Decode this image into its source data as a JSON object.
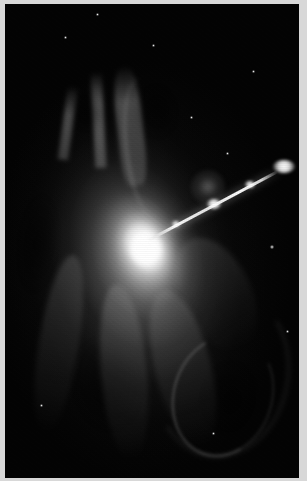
{
  "image": {
    "kind": "astronomical-photograph",
    "subject": "active galaxy with relativistic jet",
    "color_mode": "grayscale",
    "width_px": 307,
    "height_px": 481,
    "alt_text": "Grayscale astronomical image of an elliptical galaxy with a bright nucleus and a narrow jet of knots extending toward the upper right, surrounded by a diffuse filamentary halo."
  },
  "frame": {
    "border_color": "#d8d8d8",
    "sky_color": "#050505"
  },
  "features": {
    "nucleus": {
      "label": "galaxy-nucleus",
      "center_x_px": 140,
      "center_y_px": 247,
      "peak_color": "#ffffff"
    },
    "bulge": {
      "label": "inner-bulge",
      "center_x_px": 141,
      "center_y_px": 245,
      "position_angle_deg": -22
    },
    "halo": {
      "label": "diffuse-halo",
      "center_x_px": 135,
      "center_y_px": 270,
      "position_angle_deg": -14
    },
    "jet": {
      "label": "relativistic-jet",
      "origin_x_px": 148,
      "origin_y_px": 240,
      "terminus_x_px": 288,
      "terminus_y_px": 166,
      "angle_deg": -28,
      "knots": [
        {
          "name": "knot-inner",
          "x_px": 176,
          "y_px": 225,
          "size_px": 7
        },
        {
          "name": "knot-middle",
          "x_px": 213,
          "y_px": 205,
          "size_px": 11
        },
        {
          "name": "knot-outer",
          "x_px": 249,
          "y_px": 186,
          "size_px": 8
        },
        {
          "name": "knot-terminal",
          "x_px": 283,
          "y_px": 170,
          "size_px": 17
        }
      ]
    },
    "shells": [
      {
        "name": "shell-arc-lower-right",
        "x_px": 173,
        "y_px": 334
      },
      {
        "name": "shell-arc-outer",
        "x_px": 155,
        "y_px": 290
      }
    ],
    "plumes": [
      {
        "name": "plume-north-left",
        "x_px": 72,
        "y_px": 100
      },
      {
        "name": "plume-north-center",
        "x_px": 100,
        "y_px": 88
      },
      {
        "name": "plume-north-right",
        "x_px": 128,
        "y_px": 95
      }
    ],
    "companion": {
      "label": "faint-companion-nebulosity",
      "x_px": 203,
      "y_px": 183
    },
    "stars": [
      {
        "x_px": 270,
        "y_px": 245,
        "size_px": 3
      },
      {
        "x_px": 226,
        "y_px": 152,
        "size_px": 2
      },
      {
        "x_px": 64,
        "y_px": 36,
        "size_px": 2
      },
      {
        "x_px": 152,
        "y_px": 44,
        "size_px": 2
      },
      {
        "x_px": 252,
        "y_px": 70,
        "size_px": 2
      },
      {
        "x_px": 286,
        "y_px": 330,
        "size_px": 2
      },
      {
        "x_px": 40,
        "y_px": 404,
        "size_px": 2
      },
      {
        "x_px": 212,
        "y_px": 432,
        "size_px": 2
      },
      {
        "x_px": 96,
        "y_px": 12,
        "size_px": 2
      },
      {
        "x_px": 190,
        "y_px": 116,
        "size_px": 2
      }
    ]
  }
}
